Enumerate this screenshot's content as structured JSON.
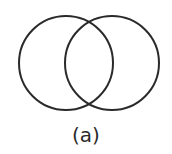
{
  "diagram": {
    "type": "venn",
    "caption": "(a)",
    "stroke_color": "#2a2a2a",
    "circles": [
      {
        "name": "left",
        "cx": 66,
        "cy": 63,
        "r": 47
      },
      {
        "name": "right",
        "cx": 112,
        "cy": 63,
        "r": 47
      }
    ]
  }
}
